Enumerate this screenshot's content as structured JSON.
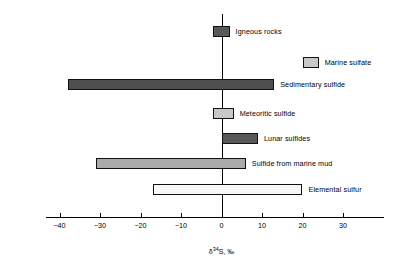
{
  "chart_data": {
    "type": "bar",
    "orientation": "horizontal",
    "title": "",
    "subtitle": "",
    "xlabel": "δ ³⁴S, ‰",
    "ylabel": "",
    "xlim": [
      -43,
      38
    ],
    "xticks": [
      -40,
      -30,
      -20,
      -10,
      0,
      10,
      20,
      30
    ],
    "xticklabels": [
      "−40",
      "−30",
      "−20",
      "−10",
      "0",
      "10",
      "20",
      "30"
    ],
    "grid": false,
    "legend": "none",
    "zero_reference_line": true,
    "note": "Ranges of sulfur isotope composition for different sulfur reservoirs; each bar spans a min-max interval.",
    "categories": [
      "Igneous rocks",
      "Marine sulfate",
      "Sedimentary sulfide",
      "Meteoritic sulfide",
      "Lunar sulfides",
      "Sulfide from marine mud",
      "Elemental sulfur"
    ],
    "ranges": [
      {
        "label": "Igneous rocks",
        "start": -2,
        "end": 2,
        "fill": "#595959"
      },
      {
        "label": "Marine sulfate",
        "start": 20,
        "end": 24,
        "fill": "#c8c8c8"
      },
      {
        "label": "Sedimentary sulfide",
        "start": -38,
        "end": 13,
        "fill": "#4f4f4f"
      },
      {
        "label": "Meteoritic sulfide",
        "start": -2,
        "end": 3,
        "fill": "#c8c8c8"
      },
      {
        "label": "Lunar sulfides",
        "start": 0,
        "end": 9,
        "fill": "#595959"
      },
      {
        "label": "Sulfide from marine mud",
        "start": -31,
        "end": 6,
        "fill": "#aaaaaa"
      },
      {
        "label": "Elemental sulfur",
        "start": -17,
        "end": 20,
        "fill": "#f7f7f7"
      }
    ]
  },
  "axis_title_parts": {
    "delta": "δ",
    "mass": "34",
    "element": "S,",
    "permille": "‰"
  },
  "colors": {
    "axis": "#000000",
    "bar_outline": "#111111",
    "background": "#ffffff",
    "dark_fill": "#595959",
    "mid_fill": "#aaaaaa",
    "light_fill": "#c8c8c8",
    "white_fill": "#f7f7f7"
  }
}
